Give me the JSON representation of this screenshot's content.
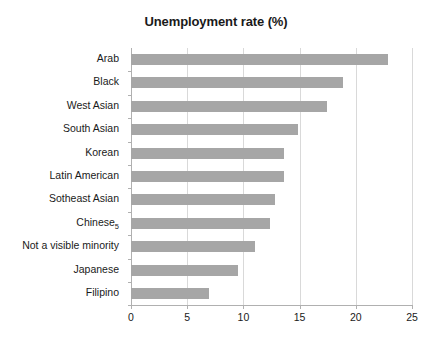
{
  "chart_data": {
    "type": "bar",
    "orientation": "horizontal",
    "title": "Unemployment rate (%)",
    "xlabel": "",
    "ylabel": "",
    "xlim": [
      0,
      25
    ],
    "xticks": [
      0,
      5,
      10,
      15,
      20,
      25
    ],
    "grid": "vertical",
    "legend": null,
    "bar_color": "#a6a6a6",
    "categories": [
      "Arab",
      "Black",
      "West Asian",
      "South Asian",
      "Korean",
      "Latin American",
      "Sotheast Asian",
      "Chinese",
      "Not a visible minority",
      "Japanese",
      "Filipino"
    ],
    "category_footnotes": [
      "",
      "",
      "",
      "",
      "",
      "",
      "",
      "5",
      "",
      "",
      ""
    ],
    "values": [
      22.9,
      18.9,
      17.4,
      14.9,
      13.6,
      13.6,
      12.8,
      12.4,
      11.0,
      9.5,
      6.9
    ]
  }
}
